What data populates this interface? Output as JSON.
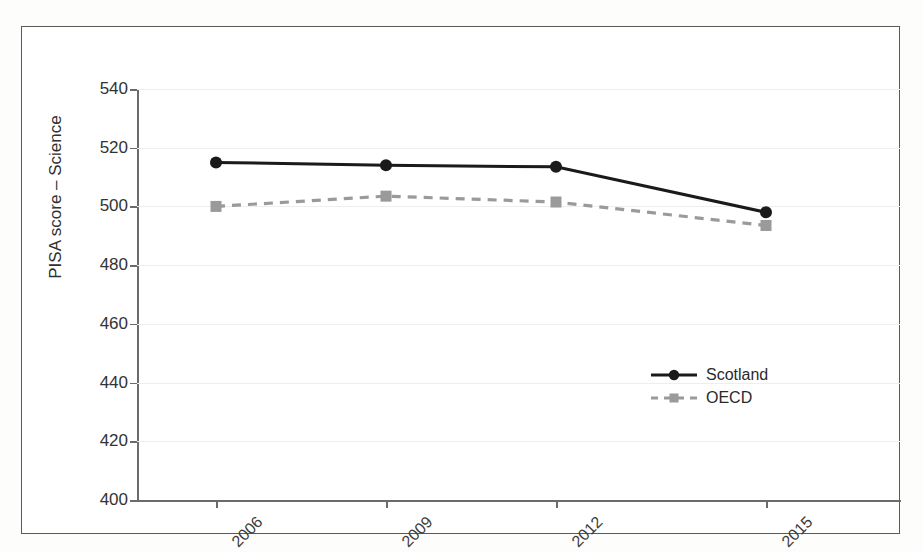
{
  "chart_data": {
    "type": "line",
    "title": "",
    "xlabel": "",
    "ylabel": "PISA score – Science",
    "categories": [
      "2006",
      "2009",
      "2012",
      "2015"
    ],
    "ylim": [
      400,
      540
    ],
    "yticks": [
      400,
      420,
      440,
      460,
      480,
      500,
      520,
      540
    ],
    "grid": true,
    "legend_position": "inside-lower-right",
    "series": [
      {
        "name": "Scotland",
        "values": [
          515,
          514,
          513.5,
          498
        ],
        "color": "#1a1a1a",
        "line_style": "solid",
        "marker": "circle"
      },
      {
        "name": "OECD",
        "values": [
          500,
          503.5,
          501.5,
          493.5
        ],
        "color": "#9a9a9a",
        "line_style": "dashed",
        "marker": "square"
      }
    ]
  },
  "axis": {
    "y_title": "PISA score – Science",
    "y_tick_labels": [
      "540",
      "520",
      "500",
      "480",
      "460",
      "440",
      "420",
      "400"
    ],
    "x_tick_labels": [
      "2006",
      "2009",
      "2012",
      "2015"
    ]
  },
  "legend": {
    "entries": [
      {
        "label": "Scotland"
      },
      {
        "label": "OECD"
      }
    ]
  },
  "colors": {
    "scotland": "#1a1a1a",
    "oecd": "#9a9a9a",
    "grid": "#eeeeee",
    "axis": "#6b6b6b",
    "frame": "#5a5a5a",
    "text": "#2f2f2f"
  }
}
